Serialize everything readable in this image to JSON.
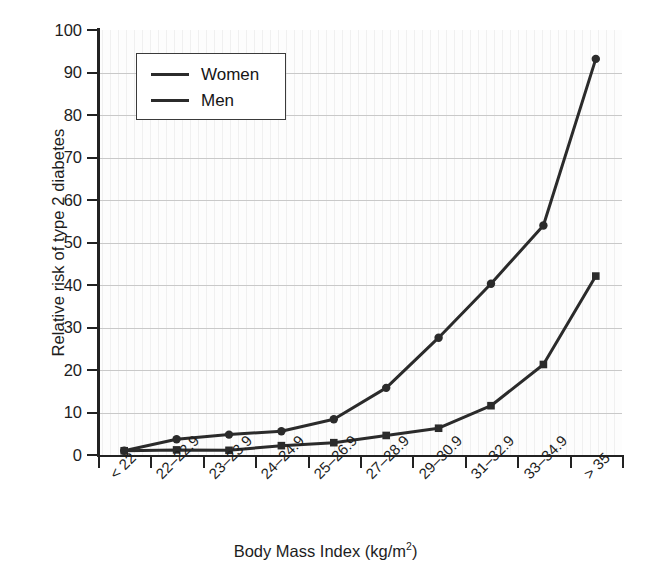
{
  "figure": {
    "background_color": "#ffffff",
    "plot_background_color": "#fdfdfd",
    "line_color": "#2b2b2b",
    "grid_color": "#c9c9c9",
    "axis_color": "#222222"
  },
  "legend": {
    "position": "upper-left-inside",
    "entries": [
      {
        "label": "Women",
        "marker": "circle"
      },
      {
        "label": "Men",
        "marker": "square"
      }
    ]
  },
  "caption": {
    "partial_text": ""
  },
  "chart_data": {
    "type": "line",
    "title": "",
    "subtitle": "",
    "xlabel": "Body Mass Index (kg/m2)",
    "xlabel_display": "Body Mass Index (kg/m",
    "xlabel_superscript": "2",
    "xlabel_tail": ")",
    "ylabel": "Relative risk of  type 2 diabetes",
    "ylim": [
      0,
      100
    ],
    "ytick_labels": [
      "0",
      "10",
      "20",
      "30",
      "40",
      "50",
      "60",
      "70",
      "80",
      "90",
      "100"
    ],
    "ytick_values": [
      0,
      10,
      20,
      30,
      40,
      50,
      60,
      70,
      80,
      90,
      100
    ],
    "grid": true,
    "grid_axis": "y",
    "categories": [
      "< 22",
      "22–22.9",
      "23–23.9",
      "24–24.9",
      "25–26.9",
      "27–28.9",
      "29–30.9",
      "31–32.9",
      "33–34.9",
      "> 35"
    ],
    "series": [
      {
        "name": "Women",
        "marker": "circle",
        "color": "#2b2b2b",
        "values": [
          1.0,
          3.7,
          4.8,
          5.6,
          8.4,
          15.8,
          27.6,
          40.3,
          54.0,
          93.2
        ]
      },
      {
        "name": "Men",
        "marker": "square",
        "color": "#2b2b2b",
        "values": [
          1.0,
          1.2,
          1.1,
          2.2,
          2.9,
          4.6,
          6.3,
          11.6,
          21.3,
          42.1
        ]
      }
    ]
  }
}
